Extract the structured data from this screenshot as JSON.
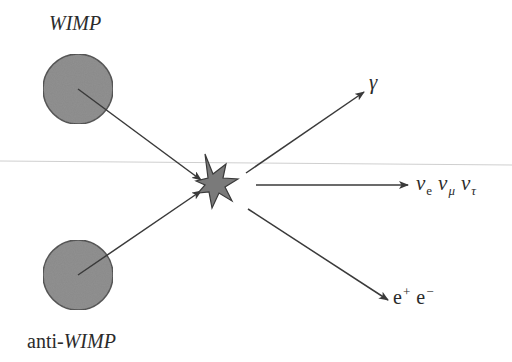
{
  "particles": {
    "wimp": {
      "label": "WIMP",
      "center": [
        78,
        89
      ],
      "radius": 35,
      "fill": "#8a8a8a",
      "stroke": "#444444"
    },
    "anti_wimp": {
      "label_prefix": "anti-",
      "label_main": "WIMP",
      "center": [
        78,
        275
      ],
      "radius": 35,
      "fill": "#8a8a8a",
      "stroke": "#444444"
    }
  },
  "vertex": {
    "shape": "star",
    "center": [
      218,
      185
    ],
    "fill": "#7a7a7a",
    "stroke": "#3a3a3a"
  },
  "products": [
    {
      "name": "photon",
      "symbol": "γ"
    },
    {
      "name": "neutrinos",
      "items": [
        {
          "symbol": "ν",
          "subscript": "e"
        },
        {
          "symbol": "ν",
          "subscript": "μ"
        },
        {
          "symbol": "ν",
          "subscript": "τ"
        }
      ]
    },
    {
      "name": "electron-positron",
      "items": [
        {
          "symbol": "e",
          "superscript": "+"
        },
        {
          "symbol": "e",
          "superscript": "−"
        }
      ]
    }
  ],
  "colors": {
    "line": "#3a3a3a",
    "rule": "#c8c8c8",
    "circle_fill": "#8a8a8a",
    "star_fill": "#7a7a7a"
  }
}
